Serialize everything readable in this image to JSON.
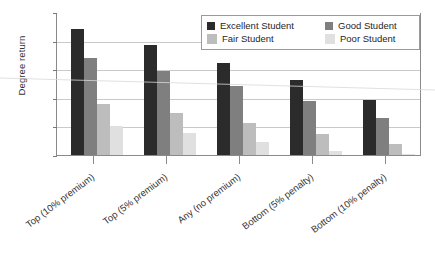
{
  "chart_data": {
    "type": "bar",
    "title": "",
    "xlabel": "",
    "ylabel": "Degree return",
    "ylim": [
      0,
      10
    ],
    "y_tick_labels": [
      "10%",
      "8%",
      "6%",
      "4%",
      "2%",
      "0%"
    ],
    "y_tick_values": [
      10,
      8,
      6,
      4,
      2,
      0
    ],
    "grid": true,
    "legend_position": "top-right",
    "categories": [
      "Top (10% premium)",
      "Top (5% premium)",
      "Any (no premium)",
      "Bottom (5% penalty)",
      "Bottom (10% penalty)"
    ],
    "series": [
      {
        "name": "Excellent Student",
        "color": "#2b2b2b",
        "values": [
          8.8,
          7.7,
          6.45,
          5.25,
          3.85
        ]
      },
      {
        "name": "Good Student",
        "color": "#7f7f7f",
        "values": [
          6.75,
          5.85,
          4.85,
          3.75,
          2.6
        ]
      },
      {
        "name": "Fair Student",
        "color": "#bdbdbd",
        "values": [
          3.55,
          2.95,
          2.25,
          1.45,
          0.75
        ]
      },
      {
        "name": "Poor Student",
        "color": "#e0e0e0",
        "values": [
          2.05,
          1.55,
          0.9,
          0.3,
          0.05
        ]
      }
    ]
  },
  "legend": {
    "items": [
      {
        "label": "Excellent Student",
        "color": "#2b2b2b"
      },
      {
        "label": "Good Student",
        "color": "#7f7f7f"
      },
      {
        "label": "Fair Student",
        "color": "#bdbdbd"
      },
      {
        "label": "Poor Student",
        "color": "#e0e0e0"
      }
    ]
  },
  "axes": {
    "y_title": "Degree return"
  }
}
